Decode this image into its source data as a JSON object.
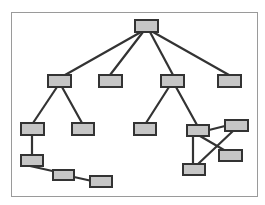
{
  "diagram": {
    "type": "tree-graph",
    "frame": {
      "x": 11,
      "y": 12,
      "w": 246,
      "h": 184,
      "stroke": "#9a9a9a"
    },
    "style": {
      "node_fill": "#c6c6c6",
      "node_stroke": "#333333",
      "edge_stroke": "#333333",
      "edge_width": 2.2
    },
    "nodes": [
      {
        "id": "n0",
        "x": 135,
        "y": 20,
        "w": 23,
        "h": 12
      },
      {
        "id": "n1",
        "x": 48,
        "y": 75,
        "w": 23,
        "h": 12
      },
      {
        "id": "n2",
        "x": 99,
        "y": 75,
        "w": 23,
        "h": 12
      },
      {
        "id": "n3",
        "x": 161,
        "y": 75,
        "w": 23,
        "h": 12
      },
      {
        "id": "n4",
        "x": 218,
        "y": 75,
        "w": 23,
        "h": 12
      },
      {
        "id": "n5",
        "x": 21,
        "y": 123,
        "w": 23,
        "h": 12
      },
      {
        "id": "n6",
        "x": 72,
        "y": 123,
        "w": 22,
        "h": 12
      },
      {
        "id": "n7",
        "x": 134,
        "y": 123,
        "w": 22,
        "h": 12
      },
      {
        "id": "n8",
        "x": 187,
        "y": 125,
        "w": 22,
        "h": 11
      },
      {
        "id": "n9",
        "x": 225,
        "y": 120,
        "w": 23,
        "h": 11
      },
      {
        "id": "n10",
        "x": 219,
        "y": 150,
        "w": 23,
        "h": 11
      },
      {
        "id": "n11",
        "x": 183,
        "y": 164,
        "w": 22,
        "h": 11
      },
      {
        "id": "n12",
        "x": 21,
        "y": 155,
        "w": 22,
        "h": 11
      },
      {
        "id": "n13",
        "x": 53,
        "y": 170,
        "w": 21,
        "h": 10
      },
      {
        "id": "n14",
        "x": 90,
        "y": 176,
        "w": 22,
        "h": 11
      }
    ],
    "edges": [
      {
        "from": [
          141,
          32
        ],
        "to": [
          65,
          75
        ]
      },
      {
        "from": [
          143,
          32
        ],
        "to": [
          110,
          75
        ]
      },
      {
        "from": [
          150,
          32
        ],
        "to": [
          173,
          75
        ]
      },
      {
        "from": [
          153,
          32
        ],
        "to": [
          229,
          75
        ]
      },
      {
        "from": [
          57,
          87
        ],
        "to": [
          33,
          123
        ]
      },
      {
        "from": [
          62,
          87
        ],
        "to": [
          82,
          123
        ]
      },
      {
        "from": [
          169,
          87
        ],
        "to": [
          146,
          123
        ]
      },
      {
        "from": [
          176,
          87
        ],
        "to": [
          197,
          125
        ]
      },
      {
        "from": [
          32,
          135
        ],
        "to": [
          32,
          155
        ]
      },
      {
        "from": [
          30,
          166
        ],
        "to": [
          57,
          172
        ]
      },
      {
        "from": [
          74,
          177
        ],
        "to": [
          92,
          181
        ]
      },
      {
        "from": [
          209,
          130
        ],
        "to": [
          225,
          126
        ]
      },
      {
        "from": [
          200,
          136
        ],
        "to": [
          224,
          150
        ]
      },
      {
        "from": [
          193,
          136
        ],
        "to": [
          193,
          164
        ]
      },
      {
        "from": [
          233,
          131
        ],
        "to": [
          198,
          164
        ]
      }
    ]
  }
}
